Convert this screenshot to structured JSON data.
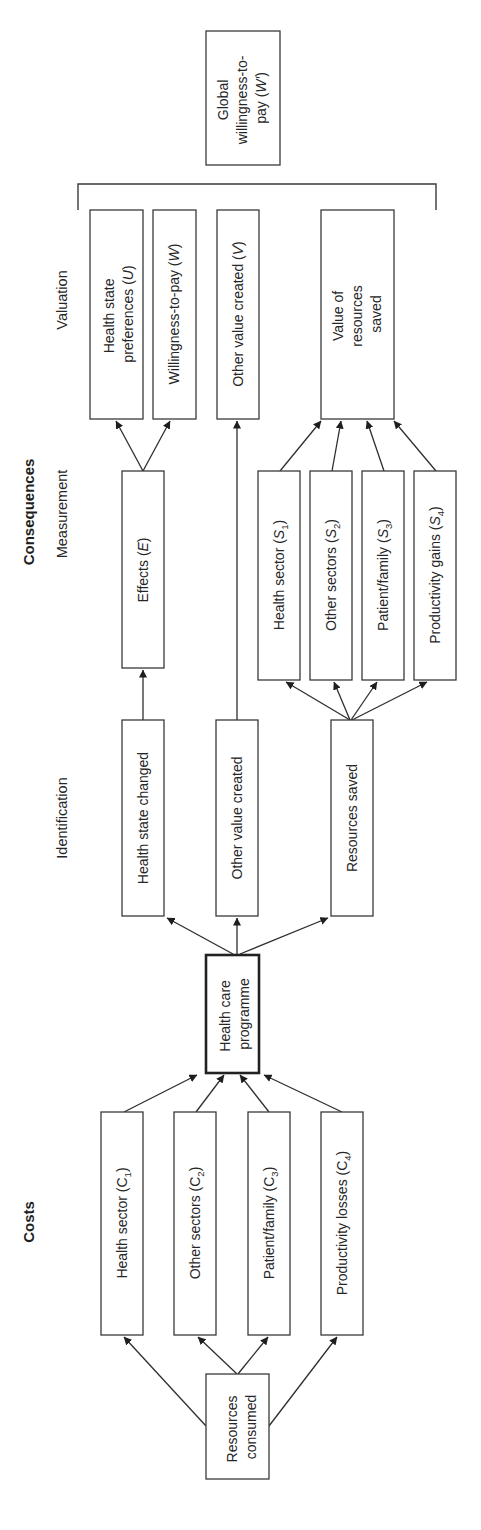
{
  "headings": {
    "costs": "Costs",
    "consequences": "Consequences",
    "identification": "Identification",
    "measurement": "Measurement",
    "valuation": "Valuation"
  },
  "nodes": {
    "resources_consumed": [
      "Resources",
      "consumed"
    ],
    "cost_health_sector": {
      "text": "Health sector (",
      "sym": "C",
      "sub": "1",
      "close": ")"
    },
    "cost_other_sectors": {
      "text": "Other sectors (",
      "sym": "C",
      "sub": "2",
      "close": ")"
    },
    "cost_patient_family": {
      "text": "Patient/family (",
      "sym": "C",
      "sub": "3",
      "close": ")"
    },
    "cost_productivity_losses": {
      "text": "Productivity losses (",
      "sym": "C",
      "sub": "4",
      "close": ")"
    },
    "health_care_programme": [
      "Health care",
      "programme"
    ],
    "health_state_changed": "Health state changed",
    "other_value_created_id": "Other value created",
    "resources_saved": "Resources saved",
    "effects": {
      "text": "Effects (",
      "sym": "E",
      "close": ")"
    },
    "saved_health_sector": {
      "text": "Health sector (",
      "sym": "S",
      "sub": "1",
      "close": ")"
    },
    "saved_other_sectors": {
      "text": "Other sectors (",
      "sym": "S",
      "sub": "2",
      "close": ")"
    },
    "saved_patient_family": {
      "text": "Patient/family (",
      "sym": "S",
      "sub": "3",
      "close": ")"
    },
    "saved_productivity_gains": {
      "text": "Productivity gains (",
      "sym": "S",
      "sub": "4",
      "close": ")"
    },
    "health_state_preferences": {
      "line1": "Health state",
      "text": "preferences (",
      "sym": "U",
      "close": ")"
    },
    "willingness_to_pay": {
      "text": "Willingness-to-pay (",
      "sym": "W",
      "close": ")"
    },
    "other_value_created_val": {
      "text": "Other value created (",
      "sym": "V",
      "close": ")"
    },
    "value_of_resources_saved": [
      "Value of",
      "resources",
      "saved"
    ],
    "global_wtp": {
      "line1": "Global",
      "line2": "willingness-to-",
      "text": "pay (",
      "sym": "W′",
      "close": ")"
    }
  },
  "edges": [
    [
      "resources_consumed",
      "cost_health_sector"
    ],
    [
      "resources_consumed",
      "cost_other_sectors"
    ],
    [
      "resources_consumed",
      "cost_patient_family"
    ],
    [
      "resources_consumed",
      "cost_productivity_losses"
    ],
    [
      "cost_health_sector",
      "health_care_programme"
    ],
    [
      "cost_other_sectors",
      "health_care_programme"
    ],
    [
      "cost_patient_family",
      "health_care_programme"
    ],
    [
      "cost_productivity_losses",
      "health_care_programme"
    ],
    [
      "health_care_programme",
      "health_state_changed"
    ],
    [
      "health_care_programme",
      "other_value_created_id"
    ],
    [
      "health_care_programme",
      "resources_saved"
    ],
    [
      "health_state_changed",
      "effects"
    ],
    [
      "other_value_created_id",
      "other_value_created_val"
    ],
    [
      "resources_saved",
      "saved_health_sector"
    ],
    [
      "resources_saved",
      "saved_other_sectors"
    ],
    [
      "resources_saved",
      "saved_patient_family"
    ],
    [
      "resources_saved",
      "saved_productivity_gains"
    ],
    [
      "effects",
      "health_state_preferences"
    ],
    [
      "effects",
      "willingness_to_pay"
    ],
    [
      "saved_health_sector",
      "value_of_resources_saved"
    ],
    [
      "saved_other_sectors",
      "value_of_resources_saved"
    ],
    [
      "saved_patient_family",
      "value_of_resources_saved"
    ],
    [
      "saved_productivity_gains",
      "value_of_resources_saved"
    ]
  ],
  "colors": {
    "stroke": "#3a3a3a",
    "text": "#262626",
    "background": "#ffffff"
  }
}
